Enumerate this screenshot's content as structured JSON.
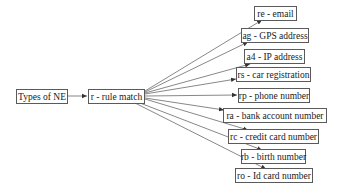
{
  "diagram": {
    "root": {
      "id": "types",
      "label": "Types of NE"
    },
    "middle": {
      "id": "rule",
      "label": "r - rule match"
    },
    "leaves": [
      {
        "id": "re",
        "label": "re - email"
      },
      {
        "id": "ag",
        "label": "ag - GPS address"
      },
      {
        "id": "a4",
        "label": "a4 - IP address"
      },
      {
        "id": "rs",
        "label": "rs - car registration"
      },
      {
        "id": "rp",
        "label": "rp - phone number"
      },
      {
        "id": "ra",
        "label": "ra - bank account number"
      },
      {
        "id": "rc",
        "label": "rc - credit card number"
      },
      {
        "id": "rb",
        "label": "rb - birth number"
      },
      {
        "id": "ro",
        "label": "ro - Id card number"
      }
    ],
    "edges": [
      [
        "types",
        "rule"
      ],
      [
        "rule",
        "re"
      ],
      [
        "rule",
        "ag"
      ],
      [
        "rule",
        "a4"
      ],
      [
        "rule",
        "rs"
      ],
      [
        "rule",
        "rp"
      ],
      [
        "rule",
        "ra"
      ],
      [
        "rule",
        "rc"
      ],
      [
        "rule",
        "rb"
      ],
      [
        "rule",
        "ro"
      ]
    ]
  }
}
